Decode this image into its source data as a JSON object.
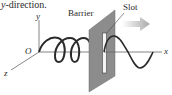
{
  "caption": {
    "italic_part": "y",
    "rest": "-direction."
  },
  "axes": {
    "y_label": "y",
    "x_label": "x",
    "z_label": "z",
    "origin_label": "O"
  },
  "labels": {
    "barrier": "Barrier",
    "slot": "Slot"
  },
  "colors": {
    "barrier_fill": "#8c8c8c",
    "barrier_edge": "#6e6e6e",
    "wave_stroke": "#2a2a2a",
    "axis_stroke": "#555555",
    "arrow_fill": "#b5b5b5",
    "slot_fill": "#f4f4f4"
  },
  "description": {
    "incoming_wave": "circularly polarized helix along x-axis",
    "outgoing_wave": "linearly polarized sine wave in y-direction after slot",
    "arrow": "direction of propagation (+x)"
  }
}
